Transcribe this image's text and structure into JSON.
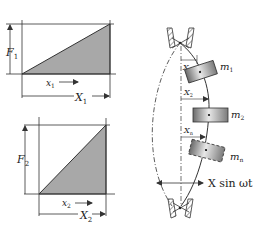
{
  "diagram": {
    "colors": {
      "line": "#333333",
      "fill": "#a8a8a8",
      "background": "#ffffff"
    },
    "panel1": {
      "force_label": "F",
      "force_sub": "1",
      "disp_label": "x",
      "disp_sub": "1",
      "max_disp_label": "X",
      "max_disp_sub": "1"
    },
    "panel2": {
      "force_label": "F",
      "force_sub": "2",
      "disp_label": "x",
      "disp_sub": "2",
      "max_disp_label": "X",
      "max_disp_sub": "2"
    },
    "beam": {
      "masses": [
        {
          "label": "m",
          "sub": "1",
          "disp_label": "X",
          "disp_sub": "1"
        },
        {
          "label": "m",
          "sub": "2",
          "disp_label": "X",
          "disp_sub": "2"
        },
        {
          "label": "m",
          "sub": "n",
          "disp_label": "X",
          "disp_sub": "n"
        }
      ],
      "excitation_label": "X sin ωt"
    }
  }
}
